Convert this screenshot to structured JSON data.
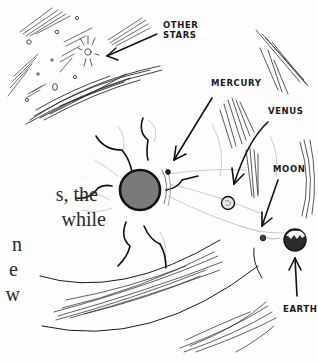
{
  "illustration": {
    "labels": {
      "other_stars_line1": "OTHER",
      "other_stars_line2": "STARS",
      "mercury": "MERCURY",
      "venus": "VENUS",
      "moon": "MOON",
      "earth": "EARTH"
    },
    "colors": {
      "ink": "#1a1a1a",
      "sun_fill": "#7a7a7a",
      "earth_fill": "#2b2b2b",
      "hatch": "#3a3a3a",
      "faint": "#bdbdbd"
    }
  },
  "body_text": {
    "lines": [
      "s, the",
      "while",
      "n",
      "e",
      "w"
    ]
  }
}
